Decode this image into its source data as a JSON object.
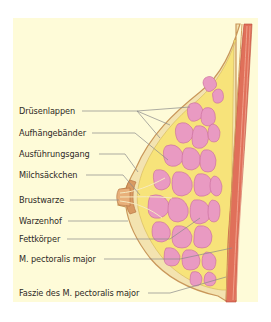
{
  "diagram": {
    "colors": {
      "background_panel": "#fefbd8",
      "skin_outline": "#c9975a",
      "subcutaneous_fat": "#f3e3b0",
      "fat_body": "#f7e37a",
      "gland_tissue": "#e99ac2",
      "gland_outline": "#c86a9a",
      "muscle": "#e0705a",
      "muscle_light": "#f0a08a",
      "nipple": "#d89a62",
      "leader_line": "#8a8a8a",
      "label_text": "#2e2a26"
    },
    "labels": [
      {
        "id": "druesenlappen",
        "text": "Drüsenlappen",
        "x": 19,
        "y": 106
      },
      {
        "id": "aufhaengebaender",
        "text": "Aufhängebänder",
        "x": 19,
        "y": 128
      },
      {
        "id": "ausfuehrungsgang",
        "text": "Ausführungsgang",
        "x": 19,
        "y": 149
      },
      {
        "id": "milchsaeckchen",
        "text": "Milchsäckchen",
        "x": 19,
        "y": 170
      },
      {
        "id": "brustwarze",
        "text": "Brustwarze",
        "x": 19,
        "y": 195
      },
      {
        "id": "warzenhof",
        "text": "Warzenhof",
        "x": 19,
        "y": 216
      },
      {
        "id": "fettkoerper",
        "text": "Fettkörper",
        "x": 19,
        "y": 234
      },
      {
        "id": "m-pectoralis-major",
        "text": "M. pectoralis major",
        "x": 19,
        "y": 254
      },
      {
        "id": "faszie",
        "text": "Faszie des M. pectoralis major",
        "x": 19,
        "y": 288
      }
    ]
  }
}
